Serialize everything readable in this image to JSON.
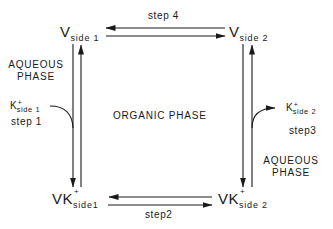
{
  "diagram": {
    "type": "ion-transport-cycle",
    "colors": {
      "ink": "#1a1a1a",
      "background": "#ffffff"
    },
    "nodes": {
      "v_side1": {
        "main": "V",
        "sub": "side 1",
        "sup": ""
      },
      "v_side2": {
        "main": "V",
        "sub": "side 2",
        "sup": ""
      },
      "vk_side1": {
        "main": "VK",
        "sub": "side1",
        "sup": "+"
      },
      "vk_side2": {
        "main": "VK",
        "sub": "side 2",
        "sup": "+"
      }
    },
    "steps": {
      "step1": "step 1",
      "step2": "step2",
      "step3": "step3",
      "step4": "step 4"
    },
    "ions": {
      "k_side1": {
        "main": "K",
        "sup": "+",
        "sub": "side 1"
      },
      "k_side2": {
        "main": "K",
        "sup": "+",
        "sub": "side 2"
      }
    },
    "phases": {
      "aqueous_left": [
        "AQUEOUS",
        "PHASE"
      ],
      "organic": "ORGANIC PHASE",
      "aqueous_right": [
        "AQUEOUS",
        "PHASE"
      ]
    },
    "edges": [
      {
        "from": "v_side2",
        "to": "v_side1",
        "label": "step 4",
        "direction": "left"
      },
      {
        "from": "v_side1",
        "to": "v_side2",
        "label": "step 4",
        "direction": "right"
      },
      {
        "from": "v_side1",
        "to": "vk_side1",
        "label": "step 1",
        "direction": "down",
        "binds": "k_side1"
      },
      {
        "from": "vk_side1",
        "to": "v_side1",
        "direction": "up"
      },
      {
        "from": "vk_side2",
        "to": "vk_side1",
        "label": "step2",
        "direction": "left"
      },
      {
        "from": "vk_side1",
        "to": "vk_side2",
        "label": "step2",
        "direction": "right"
      },
      {
        "from": "v_side2",
        "to": "vk_side2",
        "direction": "down"
      },
      {
        "from": "vk_side2",
        "to": "v_side2",
        "label": "step3",
        "direction": "up",
        "releases": "k_side2"
      }
    ]
  }
}
